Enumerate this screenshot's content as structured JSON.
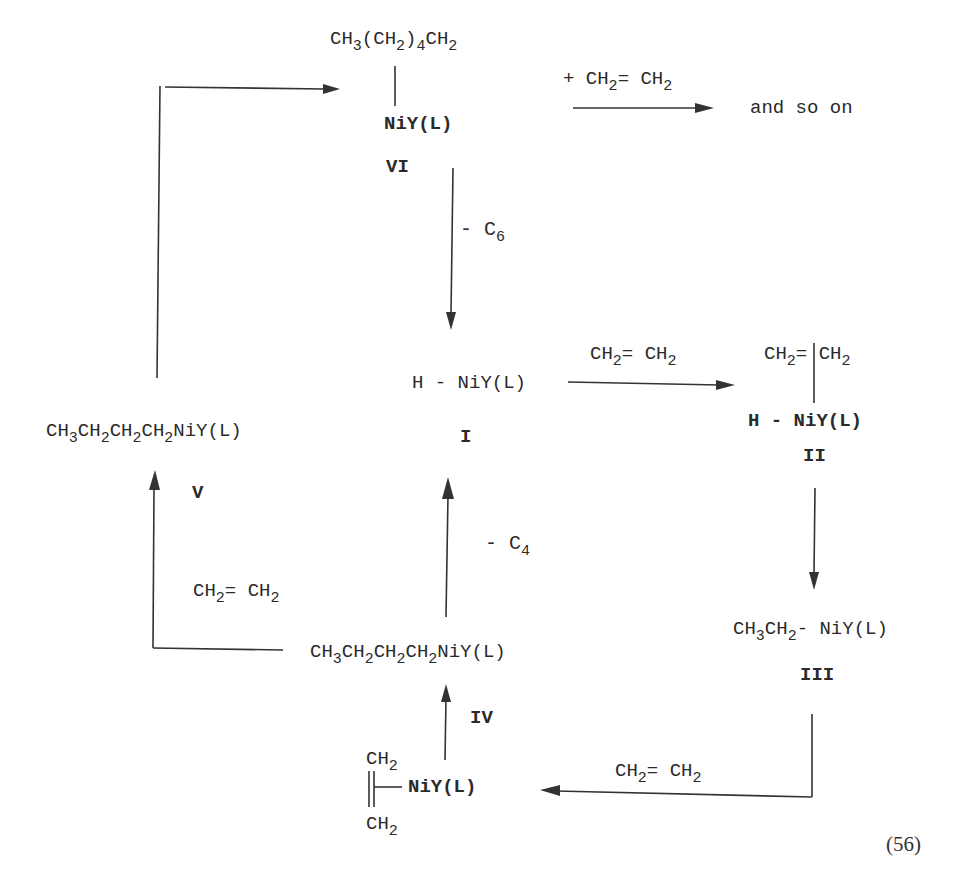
{
  "scheme": {
    "equation_number": "(56)",
    "species": {
      "I": {
        "label": "I",
        "formula_parts": [
          "H - NiY(L)"
        ]
      },
      "II": {
        "label": "II",
        "top": [
          "CH",
          "2",
          "= CH",
          "2"
        ],
        "bottom": "H - NiY(L)"
      },
      "III": {
        "label": "III",
        "formula": [
          "CH",
          "3",
          "CH",
          "2",
          "- NiY(L)"
        ]
      },
      "IV": {
        "label": "IV",
        "formula": [
          "CH",
          "3",
          "CH",
          "2",
          "CH",
          "2",
          "CH",
          "2",
          "NiY(L)"
        ]
      },
      "IV_precursor": {
        "top": [
          "CH",
          "2"
        ],
        "metal": "NiY(L)",
        "bottom": [
          "CH",
          "2"
        ]
      },
      "V": {
        "label": "V",
        "formula": [
          "CH",
          "3",
          "CH",
          "2",
          "CH",
          "2",
          "CH",
          "2",
          "NiY(L)"
        ]
      },
      "VI": {
        "label": "VI",
        "top": [
          "CH",
          "3",
          "(CH",
          "2",
          ")",
          "4",
          "CH",
          "2"
        ],
        "metal": "NiY(L)"
      }
    },
    "arrows": {
      "VI_to_I": {
        "label": [
          "- C",
          "6"
        ]
      },
      "I_to_II": {
        "label": [
          "CH",
          "2",
          "= CH",
          "2"
        ]
      },
      "III_to_IVp": {
        "label": [
          "CH",
          "2",
          "= CH",
          "2"
        ]
      },
      "IV_to_I": {
        "label": [
          "- C",
          "4"
        ]
      },
      "IV_to_V": {
        "label": [
          "CH",
          "2",
          "= CH",
          "2"
        ]
      },
      "VI_to_more": {
        "label": [
          "+ CH",
          "2",
          "= CH",
          "2"
        ],
        "result": "and so on"
      }
    }
  }
}
